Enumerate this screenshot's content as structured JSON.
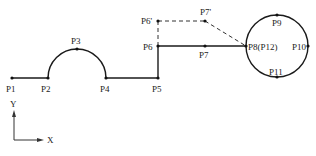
{
  "diagram": {
    "points": [
      {
        "id": "P1",
        "label": "P1",
        "x": 12,
        "y": 78,
        "lx": 6,
        "ly": 92
      },
      {
        "id": "P2",
        "label": "P2",
        "x": 48,
        "y": 78,
        "lx": 41,
        "ly": 92
      },
      {
        "id": "P3",
        "label": "P3",
        "x": 77,
        "y": 48,
        "lx": 71,
        "ly": 44
      },
      {
        "id": "P4",
        "label": "P4",
        "x": 106,
        "y": 78,
        "lx": 100,
        "ly": 92
      },
      {
        "id": "P5",
        "label": "P5",
        "x": 158,
        "y": 78,
        "lx": 152,
        "ly": 92
      },
      {
        "id": "P6",
        "label": "P6",
        "x": 158,
        "y": 46,
        "lx": 143,
        "ly": 50
      },
      {
        "id": "P6p",
        "label": "P6'",
        "x": 158,
        "y": 21,
        "lx": 141,
        "ly": 24
      },
      {
        "id": "P7p",
        "label": "P7'",
        "x": 205,
        "y": 21,
        "lx": 200,
        "ly": 15
      },
      {
        "id": "P7",
        "label": "P7",
        "x": 205,
        "y": 46,
        "lx": 199,
        "ly": 58
      },
      {
        "id": "P8",
        "label": "P8(P12)",
        "x": 246,
        "y": 46,
        "lx": 248,
        "ly": 50
      },
      {
        "id": "P9",
        "label": "P9",
        "x": 277,
        "y": 15,
        "lx": 272,
        "ly": 26
      },
      {
        "id": "P10",
        "label": "P10",
        "x": 308,
        "y": 46,
        "lx": 292,
        "ly": 50
      },
      {
        "id": "P11",
        "label": "P11",
        "x": 277,
        "y": 78,
        "lx": 269,
        "ly": 75
      }
    ],
    "axes": {
      "x_label": "X",
      "y_label": "Y"
    },
    "colors": {
      "line": "#1a1a1a",
      "background": "#ffffff"
    }
  }
}
